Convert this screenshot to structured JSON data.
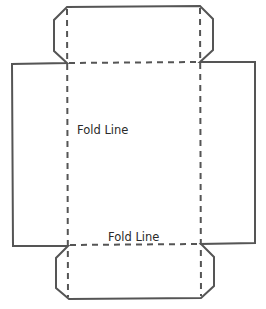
{
  "diagram": {
    "labels": {
      "fold_line_center": "Fold Line",
      "fold_line_bottom": "Fold Line"
    },
    "colors": {
      "stroke": "#555555",
      "text": "#2a2a2a",
      "background": "#ffffff"
    }
  }
}
